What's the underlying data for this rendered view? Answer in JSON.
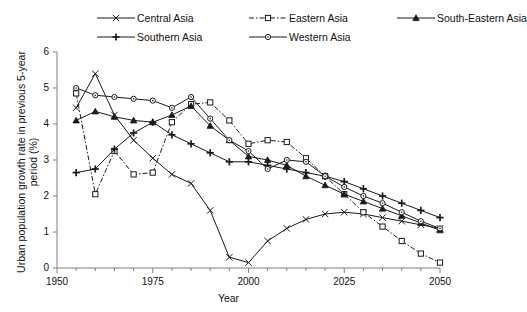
{
  "chart_data": {
    "type": "line",
    "title": "",
    "xlabel": "Year",
    "ylabel": "Urban population growth rate in previous 5-year period (%)",
    "xlim": [
      1950,
      2050
    ],
    "ylim": [
      0,
      6
    ],
    "xticks": [
      1950,
      1975,
      2000,
      2025,
      2050
    ],
    "xtick_labels": [
      "1950",
      "1975",
      "2000",
      "2025",
      "2050"
    ],
    "xminor_step": 5,
    "yticks": [
      0,
      1,
      2,
      3,
      4,
      5,
      6
    ],
    "ytick_labels": [
      "0",
      "1",
      "2",
      "3",
      "4",
      "5",
      "6"
    ],
    "grid": false,
    "legend_position": "top",
    "x": [
      1955,
      1960,
      1965,
      1970,
      1975,
      1980,
      1985,
      1990,
      1995,
      2000,
      2005,
      2010,
      2015,
      2020,
      2025,
      2030,
      2035,
      2040,
      2045,
      2050
    ],
    "series": [
      {
        "name": "Central Asia",
        "marker": "x",
        "dash": "solid",
        "values": [
          4.45,
          5.4,
          4.25,
          3.55,
          3.05,
          2.6,
          2.35,
          1.6,
          0.3,
          0.15,
          0.75,
          1.1,
          1.35,
          1.5,
          1.55,
          1.5,
          1.4,
          1.3,
          1.2,
          1.1
        ]
      },
      {
        "name": "Eastern Asia",
        "marker": "open-square",
        "dash": "dash-dot",
        "values": [
          4.85,
          2.05,
          3.25,
          2.6,
          2.65,
          4.05,
          4.55,
          4.6,
          4.1,
          3.45,
          3.55,
          3.5,
          3.05,
          2.55,
          2.05,
          1.55,
          1.15,
          0.75,
          0.4,
          0.15
        ]
      },
      {
        "name": "South-Eastern Asia",
        "marker": "filled-triangle",
        "dash": "solid",
        "values": [
          4.1,
          4.35,
          4.2,
          4.1,
          4.05,
          4.25,
          4.5,
          3.95,
          3.55,
          3.1,
          3.0,
          2.85,
          2.55,
          2.3,
          2.05,
          1.85,
          1.65,
          1.45,
          1.25,
          1.05
        ]
      },
      {
        "name": "Southern Asia",
        "marker": "plus",
        "dash": "solid",
        "values": [
          2.65,
          2.75,
          3.3,
          3.75,
          4.05,
          3.7,
          3.45,
          3.2,
          2.95,
          2.95,
          2.85,
          2.75,
          2.65,
          2.55,
          2.4,
          2.2,
          2.0,
          1.8,
          1.6,
          1.4
        ]
      },
      {
        "name": "Western Asia",
        "marker": "open-circle",
        "dash": "solid",
        "values": [
          5.0,
          4.8,
          4.75,
          4.7,
          4.65,
          4.45,
          4.75,
          4.15,
          3.55,
          3.25,
          2.75,
          3.0,
          2.95,
          2.55,
          2.25,
          2.0,
          1.8,
          1.55,
          1.3,
          1.1
        ]
      }
    ]
  }
}
